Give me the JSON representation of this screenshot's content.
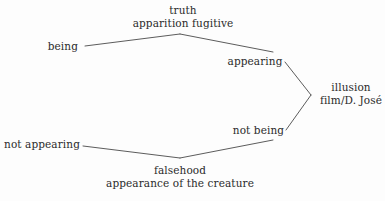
{
  "diagram": {
    "type": "hexagonal-semiotic-square",
    "background_color": "#fdfdfd",
    "line_color": "#4a4a4a",
    "text_color": "#2b2b2b",
    "nodes": [
      {
        "id": "truth",
        "label_primary": "truth",
        "label_secondary": "apparition fugitive",
        "position": "top-apex"
      },
      {
        "id": "being",
        "label_primary": "being",
        "label_secondary": "",
        "position": "upper-left"
      },
      {
        "id": "appearing",
        "label_primary": "appearing",
        "label_secondary": "",
        "position": "upper-right"
      },
      {
        "id": "illusion",
        "label_primary": "illusion",
        "label_secondary": "film/D. José",
        "position": "right-apex"
      },
      {
        "id": "not-being",
        "label_primary": "not being",
        "label_secondary": "",
        "position": "lower-right"
      },
      {
        "id": "not-appearing",
        "label_primary": "not appearing",
        "label_secondary": "",
        "position": "lower-left"
      },
      {
        "id": "falsehood",
        "label_primary": "falsehood",
        "label_secondary": "appearance of the creature",
        "position": "bottom-apex"
      }
    ],
    "edges": [
      {
        "id": "being-to-truth",
        "from": "being",
        "to": "truth",
        "x1": 85,
        "y1": 46,
        "x2": 180,
        "y2": 34
      },
      {
        "id": "truth-to-appearing",
        "from": "truth",
        "to": "appearing",
        "x1": 180,
        "y1": 34,
        "x2": 273,
        "y2": 52
      },
      {
        "id": "appearing-to-illusion",
        "from": "appearing",
        "to": "illusion",
        "x1": 285,
        "y1": 62,
        "x2": 311,
        "y2": 95
      },
      {
        "id": "illusion-to-not-being",
        "from": "illusion",
        "to": "not-being",
        "x1": 311,
        "y1": 95,
        "x2": 286,
        "y2": 130
      },
      {
        "id": "not-being-to-falsehood",
        "from": "not-being",
        "to": "falsehood",
        "x1": 273,
        "y1": 140,
        "x2": 180,
        "y2": 158
      },
      {
        "id": "falsehood-to-not-appearing",
        "from": "falsehood",
        "to": "not-appearing",
        "x1": 180,
        "y1": 158,
        "x2": 83,
        "y2": 146
      }
    ]
  }
}
